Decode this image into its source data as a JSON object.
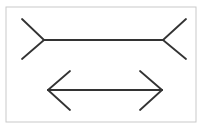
{
  "figure": {
    "type": "line-drawing",
    "canvas": {
      "width": 211,
      "height": 134,
      "background": "#ffffff"
    },
    "frame": {
      "name": "border-frame",
      "x": 6,
      "y": 7,
      "width": 190,
      "height": 115,
      "stroke": "#c9c9c9",
      "stroke_width": 1
    },
    "stroke_color": "#333333",
    "stroke_width": 1.8,
    "shafts": [
      {
        "name": "top-shaft",
        "fin_direction": "outward",
        "x1": 44,
        "y1": 40,
        "x2": 163,
        "y2": 40,
        "length_px": 119
      },
      {
        "name": "bottom-shaft",
        "fin_direction": "inward",
        "x1": 48,
        "y1": 90,
        "x2": 162,
        "y2": 90,
        "length_px": 114
      }
    ],
    "fins": [
      {
        "name": "top-left-upper-fin",
        "x1": 44,
        "y1": 40,
        "x2": 22,
        "y2": 19
      },
      {
        "name": "top-left-lower-fin",
        "x1": 44,
        "y1": 40,
        "x2": 22,
        "y2": 59
      },
      {
        "name": "top-right-upper-fin",
        "x1": 163,
        "y1": 40,
        "x2": 186,
        "y2": 19
      },
      {
        "name": "top-right-lower-fin",
        "x1": 163,
        "y1": 40,
        "x2": 186,
        "y2": 59
      },
      {
        "name": "bottom-left-upper-fin",
        "x1": 48,
        "y1": 90,
        "x2": 70,
        "y2": 71
      },
      {
        "name": "bottom-left-lower-fin",
        "x1": 48,
        "y1": 90,
        "x2": 70,
        "y2": 110
      },
      {
        "name": "bottom-right-upper-fin",
        "x1": 162,
        "y1": 90,
        "x2": 140,
        "y2": 71
      },
      {
        "name": "bottom-right-lower-fin",
        "x1": 162,
        "y1": 90,
        "x2": 140,
        "y2": 110
      }
    ]
  }
}
